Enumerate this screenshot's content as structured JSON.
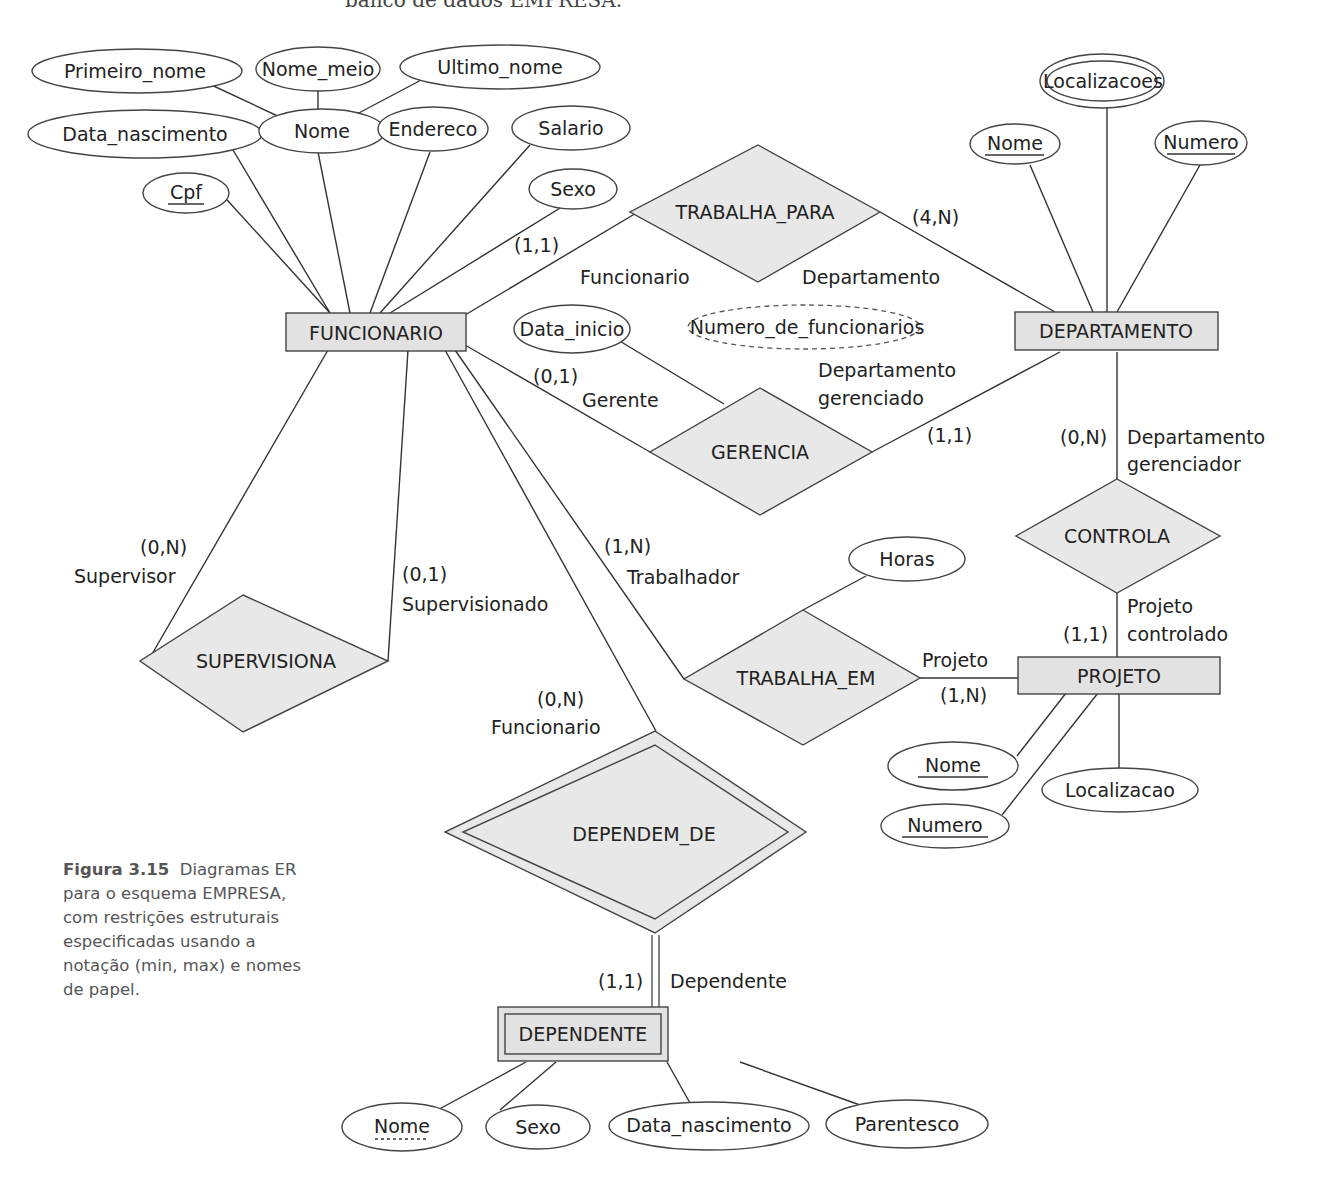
{
  "header": {
    "partial_text": "banco de dados EMPRESA."
  },
  "caption": {
    "figure_label": "Figura 3.15",
    "text": "Diagramas ER para o esquema EMPRESA, com restrições estruturais especificadas usando a notação (min, max) e nomes de papel."
  },
  "entities": {
    "funcionario": {
      "name": "FUNCIONARIO",
      "type": "strong"
    },
    "departamento": {
      "name": "DEPARTAMENTO",
      "type": "strong"
    },
    "projeto": {
      "name": "PROJETO",
      "type": "strong"
    },
    "dependente": {
      "name": "DEPENDENTE",
      "type": "weak"
    }
  },
  "relationships": {
    "trabalha_para": {
      "name": "TRABALHA_PARA",
      "type": "regular"
    },
    "gerencia": {
      "name": "GERENCIA",
      "type": "regular"
    },
    "controla": {
      "name": "CONTROLA",
      "type": "regular"
    },
    "supervisiona": {
      "name": "SUPERVISIONA",
      "type": "regular"
    },
    "trabalha_em": {
      "name": "TRABALHA_EM",
      "type": "regular"
    },
    "dependem_de": {
      "name": "DEPENDEM_DE",
      "type": "identifying"
    }
  },
  "attributes": {
    "funcionario": {
      "primeiro_nome": "Primeiro_nome",
      "nome_meio": "Nome_meio",
      "ultimo_nome": "Ultimo_nome",
      "data_nascimento": "Data_nascimento",
      "nome": "Nome",
      "endereco": "Endereco",
      "salario": "Salario",
      "cpf": "Cpf",
      "sexo": "Sexo"
    },
    "departamento": {
      "localizacoes": "Localizacoes",
      "nome": "Nome",
      "numero": "Numero",
      "numero_de_funcionarios": "Numero_de_funcionarios"
    },
    "gerencia": {
      "data_inicio": "Data_inicio"
    },
    "trabalha_em": {
      "horas": "Horas"
    },
    "projeto": {
      "nome": "Nome",
      "numero": "Numero",
      "localizacao": "Localizacao"
    },
    "dependente": {
      "nome": "Nome",
      "sexo": "Sexo",
      "data_nascimento": "Data_nascimento",
      "parentesco": "Parentesco"
    }
  },
  "constraints": {
    "trabalha_para_funcionario": "(1,1)",
    "trabalha_para_departamento": "(4,N)",
    "gerencia_gerente": "(0,1)",
    "gerencia_departamento": "(1,1)",
    "controla_departamento": "(0,N)",
    "controla_projeto": "(1,1)",
    "supervisiona_supervisor": "(0,N)",
    "supervisiona_supervisionado": "(0,1)",
    "trabalha_em_trabalhador": "(1,N)",
    "trabalha_em_projeto": "(1,N)",
    "dependem_de_funcionario": "(0,N)",
    "dependem_de_dependente": "(1,1)"
  },
  "roles": {
    "trabalha_para_funcionario": "Funcionario",
    "trabalha_para_departamento": "Departamento",
    "gerencia_gerente": "Gerente",
    "gerencia_departamento_l1": "Departamento",
    "gerencia_departamento_l2": "gerenciado",
    "controla_departamento_l1": "Departamento",
    "controla_departamento_l2": "gerenciador",
    "controla_projeto_l1": "Projeto",
    "controla_projeto_l2": "controlado",
    "supervisiona_supervisor": "Supervisor",
    "supervisiona_supervisionado": "Supervisionado",
    "trabalha_em_trabalhador": "Trabalhador",
    "trabalha_em_projeto": "Projeto",
    "dependem_de_funcionario": "Funcionario",
    "dependem_de_dependente": "Dependente"
  },
  "colors": {
    "shape_fill": "#e2e2e2",
    "stroke": "#444444",
    "background": "#ffffff",
    "caption_text": "#555555"
  }
}
